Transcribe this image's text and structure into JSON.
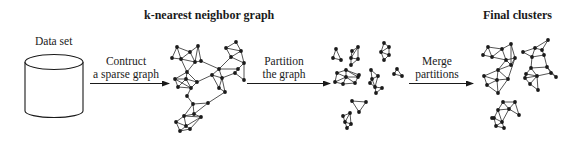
{
  "diagram": {
    "type": "pipeline",
    "stages": [
      {
        "id": "data-set",
        "label": "Data set",
        "shape": "cylinder"
      },
      {
        "id": "knn-graph",
        "label": "k-nearest neighbor graph",
        "shape": "graph"
      },
      {
        "id": "partitions",
        "label": "",
        "shape": "graph-fragments"
      },
      {
        "id": "final-clusters",
        "label": "Final clusters",
        "shape": "graph"
      }
    ],
    "arrows": [
      {
        "from": "data-set",
        "to": "knn-graph",
        "line1": "Contruct",
        "line2": "a sparse graph"
      },
      {
        "from": "knn-graph",
        "to": "partitions",
        "line1": "Partition",
        "line2": "the graph"
      },
      {
        "from": "partitions",
        "to": "final-clusters",
        "line1": "Merge",
        "line2": "partitions"
      }
    ]
  },
  "labels": {
    "data_set": "Data set",
    "knn_title": "k-nearest neighbor graph",
    "final_title": "Final clusters",
    "arrow1_line1": "Contruct",
    "arrow1_line2": "a sparse graph",
    "arrow2_line1": "Partition",
    "arrow2_line2": "the graph",
    "arrow3_line1": "Merge",
    "arrow3_line2": "partitions"
  },
  "graphs": {
    "knn": {
      "nodes": [
        [
          177,
          47
        ],
        [
          190,
          52
        ],
        [
          198,
          46
        ],
        [
          172,
          58
        ],
        [
          181,
          59
        ],
        [
          201,
          61
        ],
        [
          195,
          62
        ],
        [
          187,
          72
        ],
        [
          175,
          79
        ],
        [
          186,
          79
        ],
        [
          197,
          82
        ],
        [
          178,
          87
        ],
        [
          191,
          88
        ],
        [
          187,
          96
        ],
        [
          236,
          42
        ],
        [
          226,
          48
        ],
        [
          241,
          51
        ],
        [
          231,
          57
        ],
        [
          244,
          63
        ],
        [
          219,
          69
        ],
        [
          238,
          69
        ],
        [
          212,
          75
        ],
        [
          222,
          78
        ],
        [
          235,
          73
        ],
        [
          244,
          80
        ],
        [
          219,
          88
        ],
        [
          225,
          92
        ],
        [
          193,
          104
        ],
        [
          208,
          103
        ],
        [
          184,
          116
        ],
        [
          201,
          117
        ],
        [
          176,
          122
        ],
        [
          186,
          126
        ],
        [
          180,
          131
        ],
        [
          190,
          129
        ],
        [
          194,
          114
        ]
      ],
      "edges": [
        [
          0,
          1
        ],
        [
          1,
          2
        ],
        [
          0,
          3
        ],
        [
          0,
          4
        ],
        [
          3,
          4
        ],
        [
          1,
          4
        ],
        [
          2,
          6
        ],
        [
          1,
          6
        ],
        [
          4,
          6
        ],
        [
          2,
          5
        ],
        [
          5,
          6
        ],
        [
          4,
          7
        ],
        [
          6,
          7
        ],
        [
          7,
          8
        ],
        [
          7,
          9
        ],
        [
          7,
          10
        ],
        [
          8,
          9
        ],
        [
          9,
          10
        ],
        [
          8,
          11
        ],
        [
          9,
          11
        ],
        [
          9,
          12
        ],
        [
          10,
          12
        ],
        [
          11,
          12
        ],
        [
          12,
          13
        ],
        [
          8,
          12
        ],
        [
          5,
          19
        ],
        [
          10,
          21
        ],
        [
          14,
          15
        ],
        [
          14,
          16
        ],
        [
          15,
          16
        ],
        [
          15,
          17
        ],
        [
          16,
          17
        ],
        [
          16,
          18
        ],
        [
          17,
          18
        ],
        [
          17,
          19
        ],
        [
          19,
          20
        ],
        [
          18,
          20
        ],
        [
          20,
          23
        ],
        [
          18,
          24
        ],
        [
          23,
          24
        ],
        [
          19,
          21
        ],
        [
          19,
          22
        ],
        [
          21,
          22
        ],
        [
          22,
          23
        ],
        [
          21,
          25
        ],
        [
          22,
          25
        ],
        [
          25,
          26
        ],
        [
          22,
          26
        ],
        [
          13,
          27
        ],
        [
          26,
          28
        ],
        [
          27,
          28
        ],
        [
          27,
          35
        ],
        [
          28,
          35
        ],
        [
          27,
          29
        ],
        [
          29,
          30
        ],
        [
          35,
          30
        ],
        [
          29,
          31
        ],
        [
          29,
          32
        ],
        [
          31,
          32
        ],
        [
          31,
          33
        ],
        [
          32,
          33
        ],
        [
          32,
          34
        ],
        [
          30,
          34
        ],
        [
          33,
          34
        ],
        [
          29,
          35
        ],
        [
          30,
          32
        ]
      ]
    },
    "partitions": {
      "nodes": [
        [
          336,
          49
        ],
        [
          333,
          58
        ],
        [
          341,
          60
        ],
        [
          352,
          51
        ],
        [
          358,
          47
        ],
        [
          351,
          58
        ],
        [
          358,
          59
        ],
        [
          351,
          65
        ],
        [
          384,
          43
        ],
        [
          389,
          47
        ],
        [
          381,
          52
        ],
        [
          389,
          55
        ],
        [
          384,
          60
        ],
        [
          337,
          73
        ],
        [
          346,
          70
        ],
        [
          358,
          77
        ],
        [
          355,
          83
        ],
        [
          343,
          84
        ],
        [
          335,
          82
        ],
        [
          346,
          77
        ],
        [
          359,
          75
        ],
        [
          371,
          70
        ],
        [
          378,
          76
        ],
        [
          372,
          79
        ],
        [
          375,
          87
        ],
        [
          382,
          88
        ],
        [
          376,
          93
        ],
        [
          370,
          83
        ],
        [
          397,
          69
        ],
        [
          394,
          74
        ],
        [
          402,
          76
        ],
        [
          352,
          101
        ],
        [
          366,
          102
        ],
        [
          359,
          112
        ],
        [
          343,
          116
        ],
        [
          350,
          113
        ],
        [
          345,
          122
        ],
        [
          351,
          124
        ],
        [
          347,
          128
        ]
      ],
      "edges": [
        [
          0,
          1
        ],
        [
          0,
          2
        ],
        [
          1,
          2
        ],
        [
          3,
          4
        ],
        [
          3,
          5
        ],
        [
          4,
          5
        ],
        [
          4,
          6
        ],
        [
          5,
          6
        ],
        [
          5,
          7
        ],
        [
          6,
          7
        ],
        [
          8,
          9
        ],
        [
          8,
          10
        ],
        [
          9,
          10
        ],
        [
          9,
          11
        ],
        [
          10,
          11
        ],
        [
          10,
          12
        ],
        [
          11,
          12
        ],
        [
          13,
          14
        ],
        [
          14,
          15
        ],
        [
          14,
          19
        ],
        [
          13,
          19
        ],
        [
          13,
          18
        ],
        [
          18,
          19
        ],
        [
          18,
          17
        ],
        [
          17,
          19
        ],
        [
          17,
          16
        ],
        [
          16,
          19
        ],
        [
          16,
          15
        ],
        [
          15,
          19
        ],
        [
          14,
          20
        ],
        [
          20,
          15
        ],
        [
          21,
          22
        ],
        [
          21,
          23
        ],
        [
          22,
          23
        ],
        [
          23,
          27
        ],
        [
          23,
          24
        ],
        [
          22,
          24
        ],
        [
          24,
          25
        ],
        [
          25,
          26
        ],
        [
          24,
          26
        ],
        [
          27,
          24
        ],
        [
          28,
          29
        ],
        [
          28,
          30
        ],
        [
          29,
          30
        ],
        [
          31,
          32
        ],
        [
          32,
          33
        ],
        [
          31,
          33
        ],
        [
          34,
          35
        ],
        [
          34,
          36
        ],
        [
          35,
          36
        ],
        [
          35,
          37
        ],
        [
          36,
          37
        ],
        [
          36,
          38
        ],
        [
          37,
          38
        ]
      ]
    },
    "final": {
      "nodes": [
        [
          488,
          47
        ],
        [
          502,
          49
        ],
        [
          511,
          44
        ],
        [
          483,
          55
        ],
        [
          492,
          57
        ],
        [
          506,
          60
        ],
        [
          515,
          58
        ],
        [
          511,
          65
        ],
        [
          498,
          70
        ],
        [
          484,
          76
        ],
        [
          497,
          80
        ],
        [
          508,
          79
        ],
        [
          487,
          85
        ],
        [
          498,
          93
        ],
        [
          535,
          48
        ],
        [
          523,
          52
        ],
        [
          548,
          40
        ],
        [
          542,
          50
        ],
        [
          544,
          55
        ],
        [
          532,
          57
        ],
        [
          531,
          68
        ],
        [
          547,
          67
        ],
        [
          526,
          74
        ],
        [
          525,
          78
        ],
        [
          537,
          76
        ],
        [
          551,
          73
        ],
        [
          556,
          77
        ],
        [
          530,
          84
        ],
        [
          538,
          90
        ]
      ],
      "edges": [
        [
          0,
          1
        ],
        [
          0,
          3
        ],
        [
          0,
          4
        ],
        [
          3,
          4
        ],
        [
          1,
          4
        ],
        [
          1,
          2
        ],
        [
          2,
          6
        ],
        [
          1,
          5
        ],
        [
          4,
          5
        ],
        [
          5,
          6
        ],
        [
          6,
          7
        ],
        [
          5,
          7
        ],
        [
          2,
          7
        ],
        [
          5,
          8
        ],
        [
          7,
          8
        ],
        [
          6,
          11
        ],
        [
          8,
          10
        ],
        [
          8,
          11
        ],
        [
          10,
          11
        ],
        [
          9,
          10
        ],
        [
          9,
          12
        ],
        [
          10,
          12
        ],
        [
          12,
          13
        ],
        [
          10,
          13
        ],
        [
          11,
          13
        ],
        [
          8,
          9
        ],
        [
          14,
          15
        ],
        [
          14,
          16
        ],
        [
          16,
          17
        ],
        [
          14,
          17
        ],
        [
          17,
          18
        ],
        [
          14,
          19
        ],
        [
          18,
          19
        ],
        [
          19,
          20
        ],
        [
          18,
          21
        ],
        [
          20,
          21
        ],
        [
          20,
          22
        ],
        [
          22,
          23
        ],
        [
          21,
          25
        ],
        [
          25,
          26
        ],
        [
          21,
          26
        ],
        [
          24,
          25
        ],
        [
          20,
          24
        ],
        [
          22,
          24
        ],
        [
          23,
          27
        ],
        [
          27,
          28
        ],
        [
          24,
          28
        ],
        [
          23,
          24
        ],
        [
          24,
          27
        ],
        [
          15,
          19
        ]
      ]
    },
    "final_small": {
      "nodes": [
        [
          503,
          102
        ],
        [
          515,
          102
        ],
        [
          498,
          110
        ],
        [
          509,
          109
        ],
        [
          519,
          115
        ],
        [
          494,
          118
        ],
        [
          502,
          122
        ],
        [
          504,
          128
        ],
        [
          496,
          126
        ],
        [
          492,
          118
        ]
      ],
      "edges": [
        [
          0,
          1
        ],
        [
          0,
          2
        ],
        [
          0,
          3
        ],
        [
          1,
          3
        ],
        [
          1,
          4
        ],
        [
          3,
          4
        ],
        [
          2,
          3
        ],
        [
          2,
          5
        ],
        [
          2,
          6
        ],
        [
          5,
          6
        ],
        [
          6,
          3
        ],
        [
          6,
          7
        ],
        [
          5,
          8
        ],
        [
          8,
          7
        ],
        [
          6,
          8
        ]
      ]
    }
  }
}
